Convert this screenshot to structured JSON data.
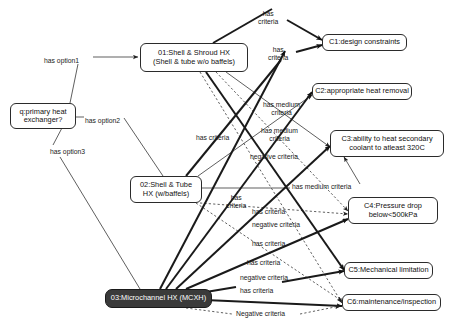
{
  "diagram": {
    "type": "decision-graph",
    "title": "",
    "background_color": "#ffffff",
    "dark_node_color": "#3a3a3a",
    "line_color": "#1a1a1a",
    "nodes": [
      {
        "id": "q",
        "label": "q:primary heat\nexchanger?",
        "style": "light",
        "x": 10,
        "y": 103,
        "w": 66,
        "h": 26
      },
      {
        "id": "o1",
        "label": "01:Shell & Shroud HX\n(Shell & tube w/o baffels)",
        "style": "light",
        "x": 140,
        "y": 43,
        "w": 108,
        "h": 29
      },
      {
        "id": "o2",
        "label": "02:Shell & Tube\nHX (w/baffels)",
        "style": "light",
        "x": 130,
        "y": 176,
        "w": 72,
        "h": 27
      },
      {
        "id": "o3",
        "label": "03:Microchannel HX (MCXH)",
        "style": "dark",
        "x": 105,
        "y": 289,
        "w": 107,
        "h": 19
      },
      {
        "id": "c1",
        "label": "C1:design constraints",
        "style": "light",
        "x": 322,
        "y": 34,
        "w": 85,
        "h": 17
      },
      {
        "id": "c2",
        "label": "C2:appropriate heat removal",
        "style": "light",
        "x": 312,
        "y": 83,
        "w": 100,
        "h": 17
      },
      {
        "id": "c3",
        "label": "C3:ability to heat secondary\ncoolant to atleast 320C",
        "style": "light",
        "x": 330,
        "y": 130,
        "w": 114,
        "h": 27
      },
      {
        "id": "c4",
        "label": "C4:Pressure drop\nbelow<500kPa",
        "style": "light",
        "x": 348,
        "y": 197,
        "w": 90,
        "h": 27
      },
      {
        "id": "c5",
        "label": "C5:Mechanical limitation",
        "style": "light",
        "x": 344,
        "y": 262,
        "w": 89,
        "h": 17
      },
      {
        "id": "c6",
        "label": "C6:maintenance/inspection",
        "style": "light",
        "x": 342,
        "y": 294,
        "w": 99,
        "h": 17
      }
    ],
    "edges": [
      {
        "id": "e01",
        "from": "q",
        "to": "o1",
        "label": "has option1",
        "weight": "thin",
        "dash": false,
        "arrow": true
      },
      {
        "id": "e02",
        "from": "q",
        "to": "o2",
        "label": "has option2",
        "weight": "thin",
        "dash": false,
        "arrow": false
      },
      {
        "id": "e03",
        "from": "q",
        "to": "o3",
        "label": "has option3",
        "weight": "thin",
        "dash": false,
        "arrow": false
      },
      {
        "id": "e04",
        "from": "o1",
        "to": "c1",
        "label": "has\ncriteria",
        "weight": "bold",
        "dash": false,
        "arrow": true
      },
      {
        "id": "e05",
        "from": "o1",
        "to": "c3",
        "label": "has medium\ncriteria",
        "weight": "thin",
        "dash": false,
        "arrow": true
      },
      {
        "id": "e06",
        "from": "o1",
        "to": "c4",
        "label": "negative criteria",
        "weight": "thin",
        "dash": true,
        "arrow": true
      },
      {
        "id": "e07",
        "from": "o1",
        "to": "c5",
        "label": "has criteria",
        "weight": "bold",
        "dash": false,
        "arrow": true
      },
      {
        "id": "e08",
        "from": "o1",
        "to": "c6",
        "label": "negative criteria",
        "weight": "thin",
        "dash": true,
        "arrow": true
      },
      {
        "id": "e09",
        "from": "o2",
        "to": "c1",
        "label": "has\ncriteria",
        "weight": "bold",
        "dash": false,
        "arrow": true
      },
      {
        "id": "e10",
        "from": "o2",
        "to": "c2",
        "label": "has medium\ncriteria",
        "weight": "thin",
        "dash": false,
        "arrow": true
      },
      {
        "id": "e11",
        "from": "o2",
        "to": "c3",
        "label": "has medium criteria",
        "weight": "thin",
        "dash": false,
        "arrow": true
      },
      {
        "id": "e12",
        "from": "o2",
        "to": "c4",
        "label": "negative criteria",
        "weight": "thin",
        "dash": true,
        "arrow": true
      },
      {
        "id": "e13",
        "from": "o2",
        "to": "c6",
        "label": "Negative criteria",
        "weight": "thin",
        "dash": true,
        "arrow": true
      },
      {
        "id": "e14",
        "from": "o3",
        "to": "c1",
        "label": "has criteria",
        "weight": "bold",
        "dash": false,
        "arrow": true
      },
      {
        "id": "e15",
        "from": "o3",
        "to": "c2",
        "label": "has\ncriteria",
        "weight": "bold",
        "dash": false,
        "arrow": true
      },
      {
        "id": "e16",
        "from": "o3",
        "to": "c3",
        "label": "has criteria",
        "weight": "bold",
        "dash": false,
        "arrow": true
      },
      {
        "id": "e17",
        "from": "o3",
        "to": "c4",
        "label": "has criteria",
        "weight": "bold",
        "dash": false,
        "arrow": true
      },
      {
        "id": "e18",
        "from": "o3",
        "to": "c5",
        "label": "has criteria",
        "weight": "bold",
        "dash": false,
        "arrow": true
      },
      {
        "id": "e19",
        "from": "o3",
        "to": "c6",
        "label": "has criteria",
        "weight": "bold",
        "dash": false,
        "arrow": true
      }
    ],
    "edge_labels": [
      {
        "id": "l-opt1",
        "text": "has option1",
        "x": 44,
        "y": 57,
        "align": "left"
      },
      {
        "id": "l-opt2",
        "text": "has option2",
        "x": 85,
        "y": 117,
        "align": "left"
      },
      {
        "id": "l-opt3",
        "text": "has option3",
        "x": 50,
        "y": 148,
        "align": "left"
      },
      {
        "id": "l-a",
        "text": "has\ncriteria",
        "x": 258,
        "y": 10,
        "align": "center"
      },
      {
        "id": "l-b",
        "text": "has\ncriteria",
        "x": 268,
        "y": 46,
        "align": "center"
      },
      {
        "id": "l-c",
        "text": "has medium\ncriteria",
        "x": 263,
        "y": 101,
        "align": "center"
      },
      {
        "id": "l-d",
        "text": "has medium\ncriteria",
        "x": 261,
        "y": 127,
        "align": "center"
      },
      {
        "id": "l-e",
        "text": "has criteria",
        "x": 196,
        "y": 134,
        "align": "left"
      },
      {
        "id": "l-f",
        "text": "negative criteria",
        "x": 250,
        "y": 153,
        "align": "left"
      },
      {
        "id": "l-g",
        "text": "has medium criteria",
        "x": 292,
        "y": 183,
        "align": "left"
      },
      {
        "id": "l-h",
        "text": "has\ncriteria",
        "x": 226,
        "y": 194,
        "align": "center"
      },
      {
        "id": "l-i",
        "text": "has criteria",
        "x": 252,
        "y": 208,
        "align": "left"
      },
      {
        "id": "l-j",
        "text": "negative criteria",
        "x": 252,
        "y": 221,
        "align": "left"
      },
      {
        "id": "l-k",
        "text": "has criteria",
        "x": 252,
        "y": 240,
        "align": "left"
      },
      {
        "id": "l-l",
        "text": "has criteria",
        "x": 247,
        "y": 259,
        "align": "left"
      },
      {
        "id": "l-m",
        "text": "negative criteria",
        "x": 240,
        "y": 274,
        "align": "left"
      },
      {
        "id": "l-n",
        "text": "has criteria",
        "x": 240,
        "y": 287,
        "align": "left"
      },
      {
        "id": "l-o",
        "text": "Negative criteria",
        "x": 236,
        "y": 310,
        "align": "left"
      }
    ],
    "wires": [
      {
        "id": "w-opt1-a",
        "d": "M 70 103 L 78 64",
        "weight": "thin",
        "dash": false,
        "arrow": false
      },
      {
        "id": "w-opt1-b",
        "d": "M 93 57 L 138 57",
        "weight": "thin",
        "dash": false,
        "arrow": true
      },
      {
        "id": "w-opt2-a",
        "d": "M 76 117 L 84 117",
        "weight": "thin",
        "dash": false,
        "arrow": false
      },
      {
        "id": "w-opt2-b",
        "d": "M 124 118 L 163 176",
        "weight": "thin",
        "dash": false,
        "arrow": false
      },
      {
        "id": "w-opt3-a",
        "d": "M 63 126 L 53 145",
        "weight": "thin",
        "dash": false,
        "arrow": false
      },
      {
        "id": "w-opt3-b",
        "d": "M 60 157 L 140 289",
        "weight": "thin",
        "dash": false,
        "arrow": false
      },
      {
        "id": "w-o1-c1-a",
        "d": "M 213 43 L 272 9",
        "weight": "bold",
        "dash": false,
        "arrow": false
      },
      {
        "id": "w-o1-c1-b",
        "d": "M 287 20 L 322 40",
        "weight": "bold",
        "dash": false,
        "arrow": true
      },
      {
        "id": "w-o1-c3",
        "d": "M 226 72 L 330 147",
        "weight": "thin",
        "dash": false,
        "arrow": true
      },
      {
        "id": "w-o1-c4",
        "d": "M 216 72 L 348 211",
        "weight": "thin",
        "dash": true,
        "arrow": true
      },
      {
        "id": "w-o1-c5",
        "d": "M 206 72 L 344 270",
        "weight": "bold",
        "dash": false,
        "arrow": true
      },
      {
        "id": "w-o1-c6",
        "d": "M 200 72 L 342 303",
        "weight": "thin",
        "dash": true,
        "arrow": true
      },
      {
        "id": "w-o2-c1-a",
        "d": "M 186 176 L 281 60",
        "weight": "bold",
        "dash": false,
        "arrow": false
      },
      {
        "id": "w-o2-c1-b",
        "d": "M 296 52 L 322 45",
        "weight": "bold",
        "dash": false,
        "arrow": true
      },
      {
        "id": "w-o2-c2",
        "d": "M 198 176 L 312 95",
        "weight": "thin",
        "dash": false,
        "arrow": true
      },
      {
        "id": "w-o2-c3-a",
        "d": "M 202 188 L 290 188",
        "weight": "thin",
        "dash": false,
        "arrow": false
      },
      {
        "id": "w-o2-c3-b",
        "d": "M 360 184 L 344 157",
        "weight": "thin",
        "dash": false,
        "arrow": true
      },
      {
        "id": "w-o2-c4",
        "d": "M 200 203 L 348 214",
        "weight": "thin",
        "dash": true,
        "arrow": true
      },
      {
        "id": "w-o2-c6",
        "d": "M 196 203 L 342 301",
        "weight": "thin",
        "dash": true,
        "arrow": true
      },
      {
        "id": "w-o3-c1",
        "d": "M 160 289 L 285 51",
        "weight": "bold",
        "dash": false,
        "arrow": true
      },
      {
        "id": "w-o3-c2",
        "d": "M 166 289 L 312 92",
        "weight": "bold",
        "dash": false,
        "arrow": true
      },
      {
        "id": "w-o3-c3",
        "d": "M 176 289 L 330 146",
        "weight": "bold",
        "dash": false,
        "arrow": true
      },
      {
        "id": "w-o3-c4",
        "d": "M 186 289 L 348 219",
        "weight": "bold",
        "dash": false,
        "arrow": true
      },
      {
        "id": "w-o3-c5-a",
        "d": "M 200 293 L 236 287",
        "weight": "bold",
        "dash": false,
        "arrow": false
      },
      {
        "id": "w-o3-c5-b",
        "d": "M 282 282 L 344 271",
        "weight": "bold",
        "dash": false,
        "arrow": true
      },
      {
        "id": "w-o3-c6",
        "d": "M 205 300 L 342 306",
        "weight": "bold",
        "dash": false,
        "arrow": true
      },
      {
        "id": "w-o3-neg",
        "d": "M 186 308 L 232 314",
        "weight": "thin",
        "dash": true,
        "arrow": false
      },
      {
        "id": "w-o3-neg2",
        "d": "M 300 314 L 340 306",
        "weight": "thin",
        "dash": true,
        "arrow": true
      }
    ]
  }
}
